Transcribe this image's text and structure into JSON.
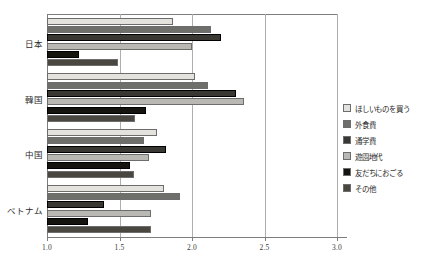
{
  "chart_data": {
    "type": "bar",
    "orientation": "horizontal",
    "title": "",
    "xlabel": "",
    "ylabel": "",
    "xlim": [
      1.0,
      3.0
    ],
    "grid": true,
    "legend_position": "right",
    "xticks": [
      "1.0",
      "1.5",
      "2.0",
      "2.5",
      "3.0"
    ],
    "xtick_values": [
      1.0,
      1.5,
      2.0,
      2.5,
      3.0
    ],
    "categories": [
      "日本",
      "韓国",
      "中国",
      "ベトナム"
    ],
    "series": [
      {
        "name": "ほしいものを買う",
        "color": "#e3e2dd",
        "values": [
          1.87,
          2.02,
          1.76,
          1.81
        ]
      },
      {
        "name": "外食費",
        "color": "#6e6e6b",
        "values": [
          2.13,
          2.11,
          1.67,
          1.92
        ]
      },
      {
        "name": "通学費",
        "color": "#3a3833",
        "values": [
          2.2,
          2.3,
          1.82,
          1.39
        ]
      },
      {
        "name": "遊園地代",
        "color": "#b9b8b3",
        "values": [
          2.0,
          2.36,
          1.7,
          1.72
        ]
      },
      {
        "name": "友だちにおごる",
        "color": "#15140f",
        "values": [
          1.22,
          1.68,
          1.57,
          1.28
        ]
      },
      {
        "name": "その他",
        "color": "#49473f",
        "values": [
          1.49,
          1.61,
          1.6,
          1.72
        ]
      }
    ]
  }
}
